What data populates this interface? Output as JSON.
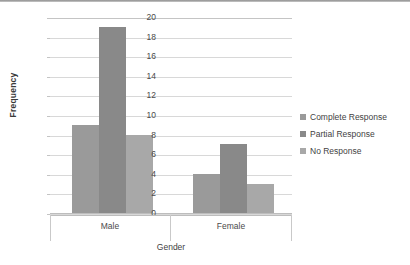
{
  "chart_data": {
    "type": "bar",
    "title": "",
    "xlabel": "Gender",
    "ylabel": "Frequency",
    "categories": [
      "Male",
      "Female"
    ],
    "series": [
      {
        "name": "Complete Response",
        "values": [
          9,
          4
        ],
        "color": "#9a9a9a"
      },
      {
        "name": "Partial Response",
        "values": [
          19,
          7
        ],
        "color": "#898989"
      },
      {
        "name": "No Response",
        "values": [
          8,
          3
        ],
        "color": "#a8a8a8"
      }
    ],
    "ylim": [
      0,
      20
    ],
    "yticks": [
      20,
      18,
      16,
      14,
      12,
      10,
      8,
      6,
      4,
      2,
      0
    ],
    "grid": true,
    "legend_position": "right",
    "bar_gap": "none"
  },
  "axis": {
    "y_title": "Frequency",
    "x_title": "Gender",
    "tick_labels": [
      "20",
      "18",
      "16",
      "14",
      "12",
      "10",
      "8",
      "6",
      "4",
      "2",
      "0"
    ]
  },
  "legend": {
    "entries": [
      {
        "label": "Complete Response"
      },
      {
        "label": "Partial Response"
      },
      {
        "label": "No Response"
      }
    ]
  },
  "colors": {
    "grid": "#d8d8d8",
    "axis": "#bdbdbd",
    "text": "#4a4a4a",
    "series_1": "#9a9a9a",
    "series_2": "#898989",
    "series_3": "#a8a8a8"
  }
}
